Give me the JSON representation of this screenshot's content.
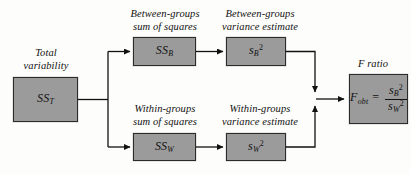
{
  "diagram": {
    "colors": {
      "box_fill": "#9b9b9b",
      "box_border": "#2b2b2b",
      "line": "#111111",
      "background": "#fdfdfb",
      "text": "#111111"
    },
    "nodes": [
      {
        "id": "total-variability",
        "caption": "Total\nvariability",
        "symbol_main": "SS",
        "symbol_sub": "T",
        "symbol_sup": ""
      },
      {
        "id": "between-groups-sum-of-squares",
        "caption": "Between-groups\nsum of squares",
        "symbol_main": "SS",
        "symbol_sub": "B",
        "symbol_sup": ""
      },
      {
        "id": "between-groups-variance-estimate",
        "caption": "Between-groups\nvariance estimate",
        "symbol_main": "s",
        "symbol_sub": "B",
        "symbol_sup": "2"
      },
      {
        "id": "within-groups-sum-of-squares",
        "caption": "Within-groups\nsum of squares",
        "symbol_main": "SS",
        "symbol_sub": "W",
        "symbol_sup": ""
      },
      {
        "id": "within-groups-variance-estimate",
        "caption": "Within-groups\nvariance estimate",
        "symbol_main": "s",
        "symbol_sub": "W",
        "symbol_sup": "2"
      },
      {
        "id": "f-ratio",
        "caption": "F ratio",
        "formula_lhs": "F",
        "formula_lhs_sub": "obt",
        "formula_equals": "=",
        "formula_num_main": "s",
        "formula_num_sub": "B",
        "formula_num_sup": "2",
        "formula_den_main": "s",
        "formula_den_sub": "W",
        "formula_den_sup": "2"
      }
    ]
  }
}
